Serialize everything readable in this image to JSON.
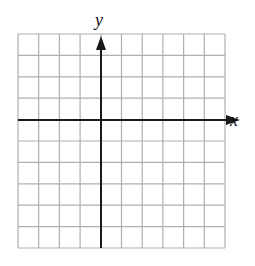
{
  "diagram": {
    "type": "coordinate-grid",
    "columns": 10,
    "rows": 10,
    "y_axis_column": 4,
    "x_axis_row": 4,
    "x_label": "x",
    "y_label": "y",
    "colors": {
      "grid": "#b0b0b0",
      "axis": "#1a1a1a"
    }
  }
}
